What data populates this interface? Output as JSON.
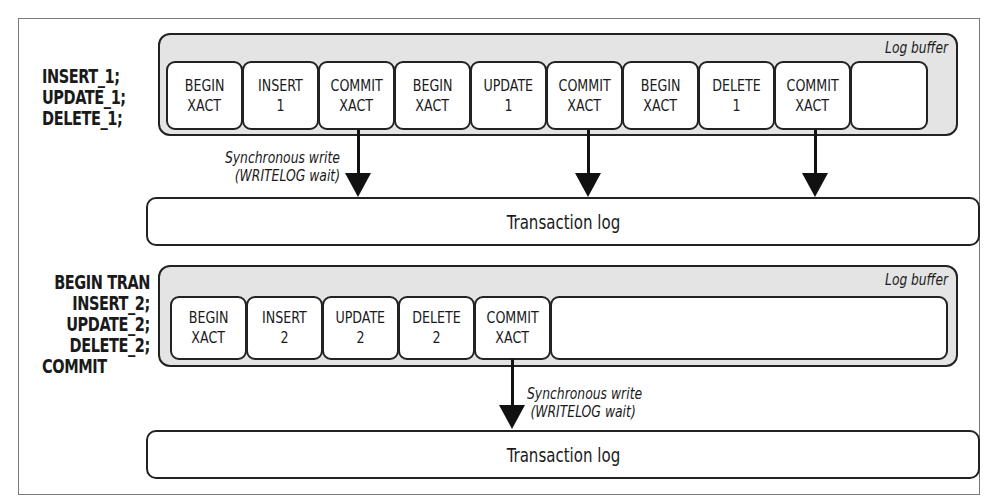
{
  "diagram": {
    "top": {
      "statements": [
        "INSERT_1;",
        "UPDATE_1;",
        "DELETE_1;"
      ],
      "buffer_label": "Log buffer",
      "cells": [
        {
          "line1": "BEGIN",
          "line2": "XACT"
        },
        {
          "line1": "INSERT",
          "line2": "1"
        },
        {
          "line1": "COMMIT",
          "line2": "XACT"
        },
        {
          "line1": "BEGIN",
          "line2": "XACT"
        },
        {
          "line1": "UPDATE",
          "line2": "1"
        },
        {
          "line1": "COMMIT",
          "line2": "XACT"
        },
        {
          "line1": "BEGIN",
          "line2": "XACT"
        },
        {
          "line1": "DELETE",
          "line2": "1"
        },
        {
          "line1": "COMMIT",
          "line2": "XACT"
        },
        {
          "line1": "",
          "line2": ""
        }
      ],
      "write_note_line1": "Synchronous write",
      "write_note_line2": "(WRITELOG wait)",
      "transaction_log_label": "Transaction log"
    },
    "bottom": {
      "statements": [
        "BEGIN TRAN",
        "INSERT_2;",
        "UPDATE_2;",
        "DELETE_2;",
        "COMMIT"
      ],
      "buffer_label": "Log buffer",
      "cells": [
        {
          "line1": "BEGIN",
          "line2": "XACT"
        },
        {
          "line1": "INSERT",
          "line2": "2"
        },
        {
          "line1": "UPDATE",
          "line2": "2"
        },
        {
          "line1": "DELETE",
          "line2": "2"
        },
        {
          "line1": "COMMIT",
          "line2": "XACT"
        }
      ],
      "write_note_line1": "Synchronous write",
      "write_note_line2": "(WRITELOG wait)",
      "transaction_log_label": "Transaction log"
    }
  }
}
